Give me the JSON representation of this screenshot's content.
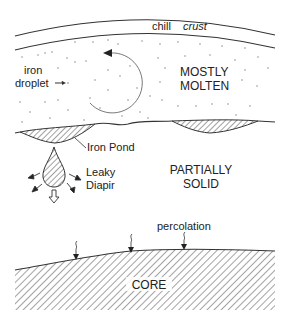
{
  "diagram": {
    "colors": {
      "ink": "#333333",
      "hatch": "#555555",
      "background": "#ffffff"
    },
    "labels": {
      "chill": "chill",
      "crust": "crust",
      "iron": "iron",
      "droplet": "droplet",
      "mostly": "MOSTLY",
      "molten": "MOLTEN",
      "iron_pond": "Iron Pond",
      "leaky": "Leaky",
      "diapir": "Diapir",
      "partially": "PARTIALLY",
      "solid": "SOLID",
      "percolation": "percolation",
      "core": "CORE"
    },
    "regions": [
      {
        "name": "chill crust",
        "type": "layer"
      },
      {
        "name": "MOSTLY MOLTEN",
        "type": "zone",
        "feature": "convection circulation arrow"
      },
      {
        "name": "Iron Pond",
        "type": "hatched lens"
      },
      {
        "name": "PARTIALLY SOLID",
        "type": "zone"
      },
      {
        "name": "Leaky Diapir",
        "type": "hatched drop",
        "feature": "sinking with leakage arrows"
      },
      {
        "name": "CORE",
        "type": "hatched body",
        "feature": "percolation arrows"
      }
    ],
    "icons": [
      "circular-arrow-icon",
      "droplet-pointer-arrow-icon",
      "leak-arrow-icon",
      "hollow-down-arrow-icon",
      "percolation-arrow-icon"
    ]
  }
}
